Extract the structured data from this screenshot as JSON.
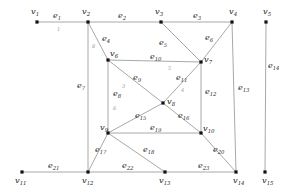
{
  "figure": {
    "type": "graph-diagram",
    "title": "",
    "node_color": "#111111",
    "edge_color": "#9e9e9e",
    "label_color": "#1a1a1a",
    "weight_color": "#9a9a9a",
    "background": "#ffffff"
  },
  "nodes": [
    {
      "id": "v1",
      "label": "v",
      "sub": "1",
      "x": 37,
      "y": 22,
      "lx": 31,
      "ly": 14
    },
    {
      "id": "v2",
      "label": "v",
      "sub": "2",
      "x": 88,
      "y": 22,
      "lx": 82,
      "ly": 14
    },
    {
      "id": "v3",
      "label": "v",
      "sub": "3",
      "x": 161,
      "y": 22,
      "lx": 155,
      "ly": 14
    },
    {
      "id": "v4",
      "label": "v",
      "sub": "4",
      "x": 232,
      "y": 22,
      "lx": 229,
      "ly": 14
    },
    {
      "id": "v5",
      "label": "v",
      "sub": "5",
      "x": 266,
      "y": 22,
      "lx": 263,
      "ly": 14
    },
    {
      "id": "v6",
      "label": "v",
      "sub": "6",
      "x": 108,
      "y": 60,
      "lx": 110,
      "ly": 56
    },
    {
      "id": "v7",
      "label": "v",
      "sub": "7",
      "x": 201,
      "y": 62,
      "lx": 204,
      "ly": 62
    },
    {
      "id": "v8",
      "label": "v",
      "sub": "8",
      "x": 163,
      "y": 103,
      "lx": 167,
      "ly": 104
    },
    {
      "id": "v9",
      "label": "v",
      "sub": "9",
      "x": 108,
      "y": 133,
      "lx": 100,
      "ly": 130
    },
    {
      "id": "v10",
      "label": "v",
      "sub": "10",
      "x": 201,
      "y": 133,
      "lx": 203,
      "ly": 131
    },
    {
      "id": "v11",
      "label": "v",
      "sub": "11",
      "x": 22,
      "y": 172,
      "lx": 15,
      "ly": 183
    },
    {
      "id": "v12",
      "label": "v",
      "sub": "12",
      "x": 88,
      "y": 172,
      "lx": 82,
      "ly": 183
    },
    {
      "id": "v13",
      "label": "v",
      "sub": "13",
      "x": 165,
      "y": 172,
      "lx": 159,
      "ly": 183
    },
    {
      "id": "v14",
      "label": "v",
      "sub": "14",
      "x": 236,
      "y": 172,
      "lx": 233,
      "ly": 183
    },
    {
      "id": "v15",
      "label": "v",
      "sub": "15",
      "x": 265,
      "y": 172,
      "lx": 262,
      "ly": 183
    }
  ],
  "edges": [
    {
      "id": "e1",
      "label": "e",
      "sub": "1",
      "from": "v1",
      "to": "v2",
      "lx": 53,
      "ly": 18,
      "weight": "1",
      "wx": 57,
      "wy": 31
    },
    {
      "id": "e2",
      "label": "e",
      "sub": "2",
      "from": "v2",
      "to": "v3",
      "lx": 118,
      "ly": 18,
      "weight": "",
      "wx": 0,
      "wy": 0
    },
    {
      "id": "e3",
      "label": "e",
      "sub": "3",
      "from": "v3",
      "to": "v4",
      "lx": 193,
      "ly": 18,
      "weight": "",
      "wx": 0,
      "wy": 0
    },
    {
      "id": "e4",
      "label": "e",
      "sub": "4",
      "from": "v2",
      "to": "v6",
      "lx": 102,
      "ly": 41,
      "weight": "8",
      "wx": 92,
      "wy": 48
    },
    {
      "id": "e5",
      "label": "e",
      "sub": "5",
      "from": "v3",
      "to": "v7",
      "lx": 159,
      "ly": 45,
      "weight": "",
      "wx": 0,
      "wy": 0
    },
    {
      "id": "e6",
      "label": "e",
      "sub": "6",
      "from": "v4",
      "to": "v7",
      "lx": 205,
      "ly": 40,
      "weight": "",
      "wx": 0,
      "wy": 0
    },
    {
      "id": "e7",
      "label": "e",
      "sub": "7",
      "from": "v2",
      "to": "v12",
      "lx": 77,
      "ly": 88,
      "weight": "",
      "wx": 0,
      "wy": 0
    },
    {
      "id": "e8",
      "label": "e",
      "sub": "8",
      "from": "v6",
      "to": "v9",
      "lx": 113,
      "ly": 96,
      "weight": "6",
      "wx": 113,
      "wy": 110
    },
    {
      "id": "e9",
      "label": "e",
      "sub": "9",
      "from": "v6",
      "to": "v8",
      "lx": 133,
      "ly": 80,
      "weight": "3",
      "wx": 122,
      "wy": 88
    },
    {
      "id": "e10",
      "label": "e",
      "sub": "10",
      "from": "v6",
      "to": "v7",
      "lx": 150,
      "ly": 59,
      "weight": "5",
      "wx": 168,
      "wy": 70
    },
    {
      "id": "e11",
      "label": "e",
      "sub": "11",
      "from": "v7",
      "to": "v8",
      "lx": 176,
      "ly": 80,
      "weight": "4",
      "wx": 181,
      "wy": 92
    },
    {
      "id": "e12",
      "label": "e",
      "sub": "12",
      "from": "v7",
      "to": "v10",
      "lx": 205,
      "ly": 94,
      "weight": "",
      "wx": 0,
      "wy": 0
    },
    {
      "id": "e13",
      "label": "e",
      "sub": "13",
      "from": "v4",
      "to": "v14",
      "lx": 238,
      "ly": 90,
      "weight": "",
      "wx": 0,
      "wy": 0
    },
    {
      "id": "e14",
      "label": "e",
      "sub": "14",
      "from": "v5",
      "to": "v15",
      "lx": 268,
      "ly": 68,
      "weight": "",
      "wx": 0,
      "wy": 0
    },
    {
      "id": "e15",
      "label": "e",
      "sub": "15",
      "from": "v9",
      "to": "v8",
      "lx": 135,
      "ly": 118,
      "weight": "",
      "wx": 0,
      "wy": 0
    },
    {
      "id": "e16",
      "label": "e",
      "sub": "16",
      "from": "v8",
      "to": "v10",
      "lx": 178,
      "ly": 118,
      "weight": "",
      "wx": 0,
      "wy": 0
    },
    {
      "id": "e17",
      "label": "e",
      "sub": "17",
      "from": "v9",
      "to": "v12",
      "lx": 95,
      "ly": 152,
      "weight": "",
      "wx": 0,
      "wy": 0
    },
    {
      "id": "e18",
      "label": "e",
      "sub": "18",
      "from": "v9",
      "to": "v13",
      "lx": 143,
      "ly": 152,
      "weight": "",
      "wx": 0,
      "wy": 0
    },
    {
      "id": "e19",
      "label": "e",
      "sub": "19",
      "from": "v9",
      "to": "v10",
      "lx": 150,
      "ly": 130,
      "weight": "",
      "wx": 0,
      "wy": 0
    },
    {
      "id": "e20",
      "label": "e",
      "sub": "20",
      "from": "v10",
      "to": "v14",
      "lx": 213,
      "ly": 152,
      "weight": "",
      "wx": 0,
      "wy": 0
    },
    {
      "id": "e21",
      "label": "e",
      "sub": "21",
      "from": "v11",
      "to": "v12",
      "lx": 48,
      "ly": 168,
      "weight": "",
      "wx": 0,
      "wy": 0
    },
    {
      "id": "e22",
      "label": "e",
      "sub": "22",
      "from": "v12",
      "to": "v13",
      "lx": 122,
      "ly": 168,
      "weight": "",
      "wx": 0,
      "wy": 0
    },
    {
      "id": "e23",
      "label": "e",
      "sub": "23",
      "from": "v13",
      "to": "v14",
      "lx": 198,
      "ly": 168,
      "weight": "",
      "wx": 0,
      "wy": 0
    }
  ]
}
